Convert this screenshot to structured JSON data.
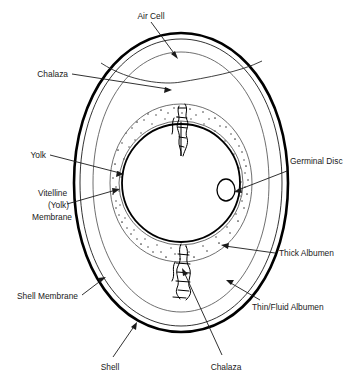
{
  "diagram": {
    "background_color": "#ffffff",
    "line_color": "#000000",
    "text_color": "#1a1a1a",
    "labels": {
      "air_cell": "Air Cell",
      "chalaza_top": "Chalaza",
      "yolk": "Yolk",
      "vitelline_line1": "Vitelline",
      "vitelline_line2": "(Yolk)",
      "vitelline_line3": "Membrane",
      "shell_membrane": "Shell Membrane",
      "shell": "Shell",
      "chalaza_bottom": "Chalaza",
      "germinal_disc": "Germinal Disc",
      "thick_albumen": "Thick Albumen",
      "thin_fluid_albumen": "Thin/Fluid Albumen"
    },
    "parts": {
      "shell_outline": "egg-shell-outline",
      "shell_membrane": "shell-membrane-outline",
      "thin_albumen": "thin-fluid-albumen-region",
      "thick_albumen": "thick-albumen-stippled-region",
      "yolk": "yolk-sphere",
      "vitelline_membrane": "vitelline-membrane-ring",
      "germinal_disc": "germinal-disc-spot",
      "air_cell": "air-cell-space",
      "chalaza_top": "chalaza-upper-twist",
      "chalaza_bottom": "chalaza-lower-twist"
    }
  }
}
